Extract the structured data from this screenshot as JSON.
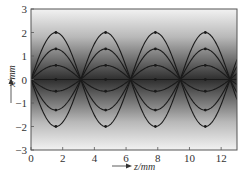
{
  "chart_data": {
    "type": "line",
    "title": "",
    "xlabel": "z/mm",
    "ylabel": "x/mm",
    "xlim": [
      0,
      13
    ],
    "ylim": [
      -3,
      3
    ],
    "xticks": [
      0,
      2,
      4,
      6,
      8,
      10,
      12
    ],
    "yticks": [
      -3,
      -2,
      -1,
      0,
      1,
      2,
      3
    ],
    "grid": false,
    "legend": null,
    "background": "vertical gray gradient, darkest at x=0, light at x=±3",
    "period_mm": 6.28,
    "series": [
      {
        "name": "ray amplitude 2.0",
        "amplitude": 2.0,
        "form": "x = A*|sin(z)|, mirrored about axis"
      },
      {
        "name": "ray amplitude 1.3",
        "amplitude": 1.3,
        "form": "x = A*|sin(z)|, mirrored about axis"
      },
      {
        "name": "ray amplitude 0.6",
        "amplitude": 0.6,
        "form": "x = A*|sin(z)|, mirrored about axis"
      },
      {
        "name": "ray amplitude -0.5",
        "amplitude": -0.5,
        "form": "x = A*|sin(z)|"
      },
      {
        "name": "ray amplitude -1.3",
        "amplitude": -1.3,
        "form": "x = A*|sin(z)|"
      },
      {
        "name": "ray amplitude -2.0",
        "amplitude": -2.0,
        "form": "x = A*|sin(z)|"
      },
      {
        "name": "axial ray",
        "amplitude": 0.0,
        "form": "x = 0"
      }
    ],
    "crossings_z": [
      0,
      3.14,
      6.28,
      9.42,
      12.57
    ],
    "peaks_z": [
      1.57,
      4.71,
      7.85,
      11.0
    ]
  },
  "labels": {
    "xlabel": "z/mm",
    "ylabel": "x/mm"
  },
  "colors": {
    "curve": "#1a1a1a",
    "frame": "#555555",
    "gradient_dark": "#2a2a2a",
    "gradient_light": "#f0f0f0"
  }
}
